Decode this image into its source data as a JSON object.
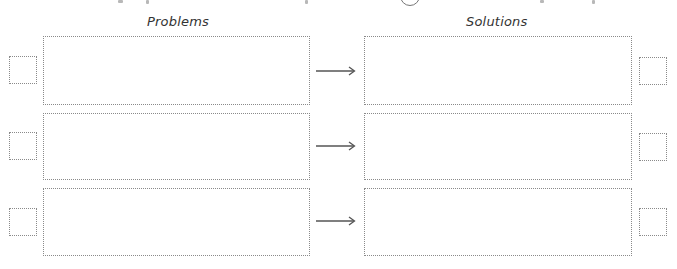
{
  "worksheet": {
    "headings": {
      "problems": "Problems",
      "solutions": "Solutions"
    },
    "rows": [
      {
        "problem_text": "",
        "solution_text": "",
        "arrow_icon": "right-arrow-icon"
      },
      {
        "problem_text": "",
        "solution_text": "",
        "arrow_icon": "right-arrow-icon"
      },
      {
        "problem_text": "",
        "solution_text": "",
        "arrow_icon": "right-arrow-icon"
      }
    ],
    "colors": {
      "border": "#8a8a8a",
      "arrow": "#555555",
      "heading": "#333333"
    }
  }
}
